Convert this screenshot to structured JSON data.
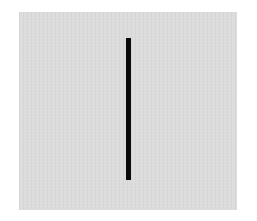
{
  "image": {
    "background_color": "#ffffff",
    "panel": {
      "color": "#dcdcdc"
    },
    "vertical_line": {
      "color": "#0a0a0a",
      "orientation": "vertical"
    }
  }
}
